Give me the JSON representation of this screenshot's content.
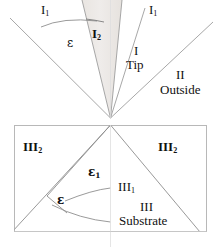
{
  "figure": {
    "background_color": "#ffffff",
    "line_color": "#9a9a9a",
    "border_color": "#b5b5b5",
    "shade_color": "#ebe7e4",
    "text_color": "#111111"
  },
  "labels": {
    "i1_left": "I",
    "i1_left_sub": "1",
    "i1_right": "I",
    "i1_right_sub": "1",
    "i2": "I",
    "i2_sub": "2",
    "epsilon_top": "ε",
    "region_i": "I",
    "region_i_name": "Tip",
    "region_ii": "II",
    "region_ii_name": "Outside",
    "iii2_left": "III",
    "iii2_left_sub": "2",
    "iii2_right": "III",
    "iii2_right_sub": "2",
    "epsilon_1": "ε",
    "epsilon_1_sub": "1",
    "iii1": "III",
    "iii1_sub": "1",
    "epsilon_bottom": "ε",
    "region_iii": "III",
    "region_iii_name": "Substrate"
  }
}
